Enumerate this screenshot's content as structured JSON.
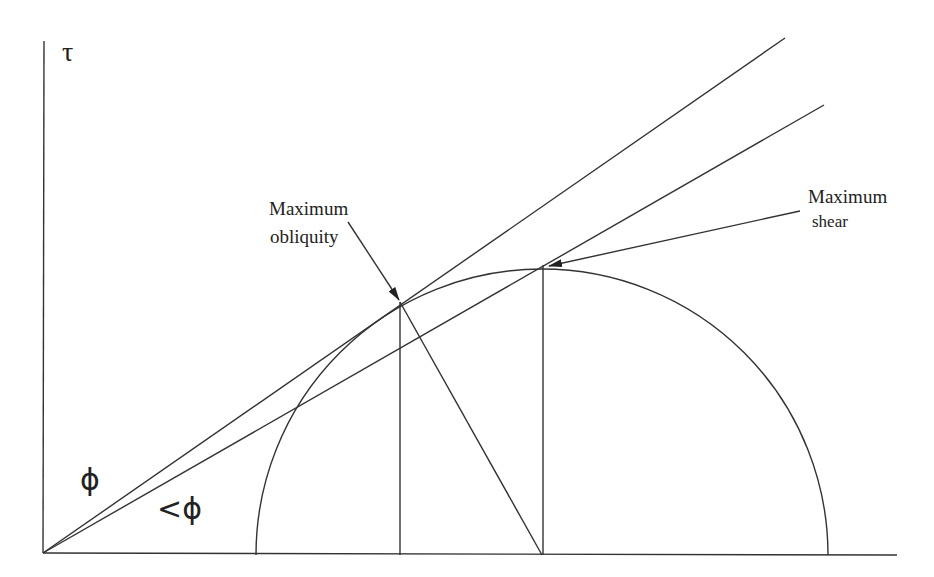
{
  "diagram": {
    "type": "Mohr circle with failure envelopes",
    "axis": {
      "y_label": "τ",
      "origin": [
        43,
        553
      ],
      "x_end": [
        897,
        555
      ],
      "y_top": [
        44,
        41
      ]
    },
    "circle": {
      "center": [
        542,
        555
      ],
      "radius": 286,
      "left_x": 256,
      "right_x": 828
    },
    "lines": {
      "envelope_phi": {
        "from": [
          43,
          553
        ],
        "to": [
          785,
          38
        ],
        "label": "ϕ"
      },
      "envelope_less_phi": {
        "from": [
          43,
          553
        ],
        "to": [
          824,
          105
        ],
        "label": "<ϕ"
      },
      "obliquity_radius": {
        "from": [
          400,
          302
        ],
        "to": [
          542,
          555
        ]
      },
      "obliquity_vertical": {
        "from": [
          400,
          302
        ],
        "to": [
          400,
          555
        ]
      },
      "shear_vertical": {
        "from": [
          543,
          265
        ],
        "to": [
          543,
          555
        ]
      }
    },
    "points": {
      "max_obliquity": [
        400,
        302
      ],
      "max_shear": [
        543,
        265
      ]
    },
    "annotations": [
      {
        "id": "max_obliquity",
        "line1": "Maximum",
        "line2": "obliquity",
        "arrow_from": [
          348,
          222
        ],
        "arrow_to": [
          399,
          300
        ]
      },
      {
        "id": "max_shear",
        "line1": "Maximum",
        "line2": "shear",
        "arrow_from": [
          800,
          211
        ],
        "arrow_to": [
          549,
          266
        ]
      }
    ],
    "colors": {
      "line": "#333333",
      "background": "#ffffff"
    }
  }
}
